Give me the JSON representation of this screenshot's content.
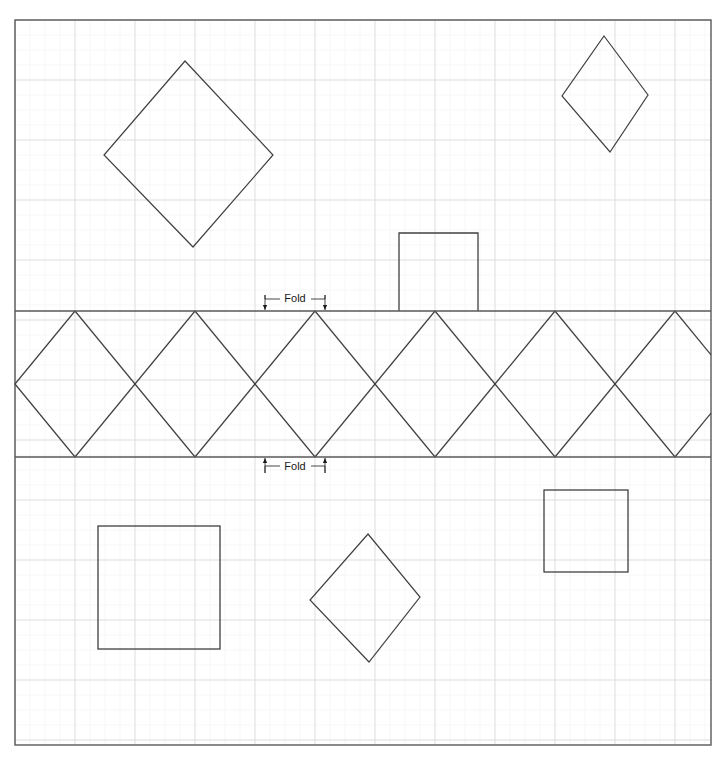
{
  "document": {
    "title": "Folded Diamond Strip Pattern",
    "canvas": {
      "width": 726,
      "height": 762,
      "background": "#ffffff"
    }
  },
  "colors": {
    "background": "#ffffff",
    "minor_grid": "#f2f2f2",
    "major_grid": "#d9d9d9",
    "border": "#595959",
    "fold_line": "#595959",
    "shape_stroke": "#404040",
    "label_text": "#1a1a1a",
    "arrow": "#1a1a1a"
  },
  "grid": {
    "minor_spacing": 15,
    "major_spacing": 60,
    "minor_stroke_width": 0.6,
    "major_stroke_width": 0.9,
    "origin_x": 15,
    "origin_y": 20
  },
  "border": {
    "x": 15,
    "y": 20,
    "width": 696,
    "height": 725,
    "stroke_width": 1.4
  },
  "fold_lines": [
    {
      "name": "top-fold-line",
      "y": 311,
      "x1": 15,
      "x2": 711,
      "stroke_width": 1.6
    },
    {
      "name": "bottom-fold-line",
      "y": 457,
      "x1": 15,
      "x2": 711,
      "stroke_width": 1.6
    }
  ],
  "fold_labels": [
    {
      "name": "fold-label-top",
      "text": "Fold",
      "text_x": 295,
      "text_y": 302,
      "leader_left_x1": 265,
      "leader_left_x2": 280,
      "leader_right_x1": 311,
      "leader_right_x2": 325,
      "leader_y": 299,
      "arrow_left_x": 265,
      "arrow_right_x": 325,
      "arrow_top_y": 295,
      "arrow_tip_y": 310,
      "direction": "down"
    },
    {
      "name": "fold-label-bottom",
      "text": "Fold",
      "text_x": 295,
      "text_y": 470,
      "leader_left_x1": 265,
      "leader_left_x2": 280,
      "leader_right_x1": 311,
      "leader_right_x2": 325,
      "leader_y": 466,
      "arrow_left_x": 265,
      "arrow_right_x": 325,
      "arrow_top_y": 473,
      "arrow_tip_y": 458,
      "direction": "up"
    }
  ],
  "zigzag_band": {
    "name": "diamond-strip",
    "top_y": 311,
    "bottom_y": 457,
    "mid_y": 384,
    "left_x": 15,
    "right_x": 711,
    "apex_pitch": 120,
    "top_apex_x": [
      75,
      195,
      315,
      435,
      555,
      675
    ],
    "bottom_apex_x": [
      75,
      195,
      315,
      435,
      555,
      675
    ],
    "left_side_vertex_x": 15,
    "right_side_vertex_x": 703,
    "stroke_width": 1.2
  },
  "shapes": [
    {
      "name": "large-diamond-top-left",
      "type": "polygon",
      "points": "185,61 273,155 193,247 104,155",
      "stroke_width": 1.2
    },
    {
      "name": "small-diamond-top-right",
      "type": "polygon",
      "points": "604,36 648,95 610,152 562,96",
      "stroke_width": 1.2
    },
    {
      "name": "rectangle-on-top-fold",
      "type": "polyline",
      "points": "399,311 399,233 478,233 478,311",
      "stroke_width": 1.3
    },
    {
      "name": "square-bottom-left",
      "type": "rect",
      "x": 98,
      "y": 526,
      "width": 122,
      "height": 123,
      "stroke_width": 1.3
    },
    {
      "name": "diamond-bottom-center",
      "type": "polygon",
      "points": "368,534 420,597 369,662 310,600",
      "stroke_width": 1.2
    },
    {
      "name": "square-bottom-right",
      "type": "rect",
      "x": 544,
      "y": 490,
      "width": 84,
      "height": 82,
      "stroke_width": 1.3
    }
  ]
}
